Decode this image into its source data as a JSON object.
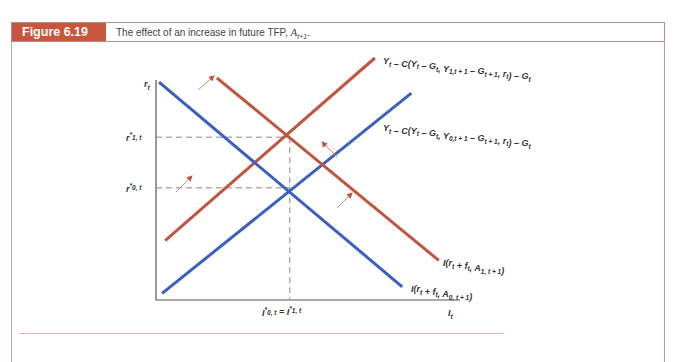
{
  "figure": {
    "label": "Figure 6.19",
    "caption": "The effect of an increase in future TFP, ",
    "caption_var": "A",
    "caption_sub": "t+1",
    "caption_end": "."
  },
  "chart_data": {
    "type": "line",
    "xlabel": "I_t",
    "ylabel": "r_t",
    "grid": false,
    "xlim": [
      0,
      100
    ],
    "ylim": [
      0,
      100
    ],
    "series": [
      {
        "name": "Y_t - C(Y_t - G_t, Y_{0,t+1} - G_{t+1}, r_t) - G_t",
        "color": "#3b5fc0",
        "x": [
          2,
          84
        ],
        "y": [
          3,
          94
        ],
        "label_lines": [
          "Y",
          "t",
          " – C(Y",
          "t",
          " – G",
          "t",
          ", Y",
          "0, t + 1",
          " – G",
          "t + 1",
          ", r",
          "t",
          ") – G",
          "t"
        ]
      },
      {
        "name": "Y_t - C(Y_t - G_t, Y_{1,t+1} - G_{t+1}, r_t) - G_t",
        "color": "#c0553f",
        "x": [
          3,
          72
        ],
        "y": [
          27,
          110
        ]
      },
      {
        "name": "I(r_t + f_t, A_{0,t+1})",
        "color": "#3b5fc0",
        "x": [
          1,
          81
        ],
        "y": [
          99,
          6
        ]
      },
      {
        "name": "I(r_t + f_t, A_{1,t+1})",
        "color": "#c0553f",
        "x": [
          20,
          93
        ],
        "y": [
          101,
          18
        ]
      }
    ],
    "annotations": {
      "r0_star": {
        "label": "r*_{0,t}",
        "y": 51
      },
      "r1_star": {
        "label": "r*_{1,t}",
        "y": 74
      },
      "I_star": {
        "label": "I*_{0,t} = I*_{1,t}",
        "x": 44
      },
      "shift_arrows": 4
    },
    "labels": {
      "y_axis": "r",
      "x_axis": "I",
      "sub_t": "t",
      "r_star_1": {
        "main": "r",
        "sup": "*",
        "sub": "1, t"
      },
      "r_star_0": {
        "main": "r",
        "sup": "*",
        "sub": "0, t"
      },
      "i_star": {
        "a": "I",
        "sub_a": "0, t",
        "eq": " = ",
        "b": "I",
        "sub_b": "1, t",
        "sup": "*"
      },
      "is_red": "Yₜ – C(Yₜ – Gₜ, Y₁,ₜ₊₁ – Gₜ₊₁, rₜ) – Gₜ",
      "is_red_parts": [
        [
          "Y",
          ""
        ],
        [
          "t",
          "sub"
        ],
        [
          " – C(Y",
          ""
        ],
        [
          "t",
          "sub"
        ],
        [
          " – G",
          ""
        ],
        [
          "t",
          "sub"
        ],
        [
          ", Y",
          ""
        ],
        [
          "1,t + 1",
          "sub"
        ],
        [
          " – G",
          ""
        ],
        [
          "t + 1",
          "sub"
        ],
        [
          ", r",
          ""
        ],
        [
          "t",
          "sub"
        ],
        [
          ") – G",
          ""
        ],
        [
          "t",
          "sub"
        ]
      ],
      "is_blue_parts": [
        [
          "Y",
          ""
        ],
        [
          "t",
          "sub"
        ],
        [
          " – C(Y",
          ""
        ],
        [
          "t",
          "sub"
        ],
        [
          " – G",
          ""
        ],
        [
          "t",
          "sub"
        ],
        [
          ", Y",
          ""
        ],
        [
          "0,t + 1",
          "sub"
        ],
        [
          " – G",
          ""
        ],
        [
          "t + 1",
          "sub"
        ],
        [
          ", r",
          ""
        ],
        [
          "t",
          "sub"
        ],
        [
          ") – G",
          ""
        ],
        [
          "t",
          "sub"
        ]
      ],
      "i_red_parts": [
        [
          "I(r",
          ""
        ],
        [
          "t",
          "sub"
        ],
        [
          " + f",
          ""
        ],
        [
          "t",
          "sub"
        ],
        [
          ", A",
          ""
        ],
        [
          "1, t + 1",
          "sub"
        ],
        [
          ")",
          ""
        ]
      ],
      "i_blue_parts": [
        [
          "I(r",
          ""
        ],
        [
          "t",
          "sub"
        ],
        [
          " + f",
          ""
        ],
        [
          "t",
          "sub"
        ],
        [
          ", A",
          ""
        ],
        [
          "0, t + 1",
          "sub"
        ],
        [
          ")",
          ""
        ]
      ]
    }
  }
}
